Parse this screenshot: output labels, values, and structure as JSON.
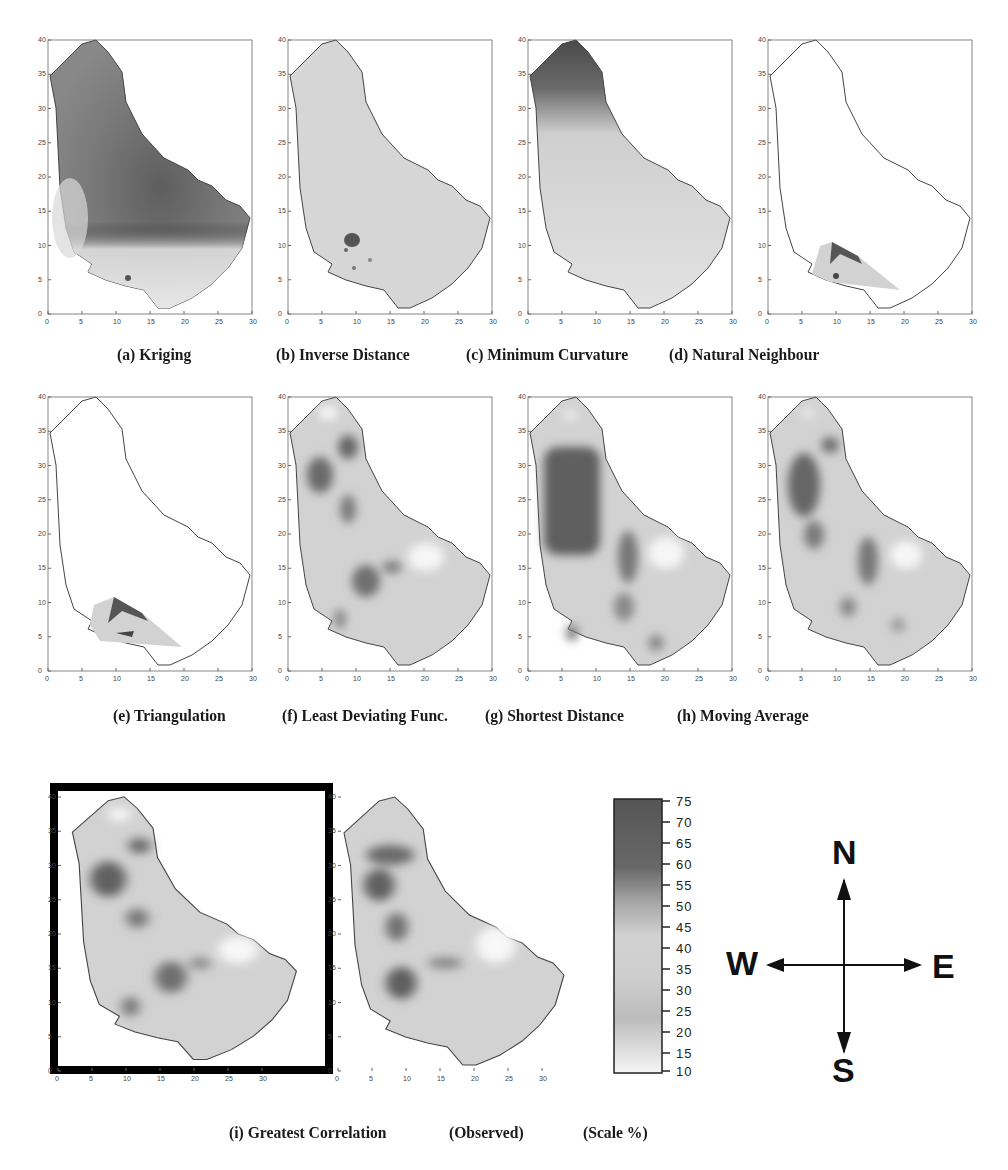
{
  "figure": {
    "row1_captions": [
      "(a) Kriging",
      "(b) Inverse Distance",
      "(c) Minimum Curvature",
      "(d) Natural Neighbour"
    ],
    "row2_captions": [
      "(e) Triangulation",
      "(f) Least Deviating Func.",
      "(g) Shortest Distance",
      "(h) Moving Average"
    ],
    "row3_captions": [
      "(i) Greatest Correlation",
      "(Observed)",
      "(Scale %)"
    ],
    "highlighted_panel": "(i) Greatest Correlation"
  },
  "axes": {
    "x_ticks": [
      "0",
      "5",
      "10",
      "15",
      "20",
      "25",
      "30"
    ],
    "y_ticks": [
      "0",
      "5",
      "10",
      "15",
      "20",
      "25",
      "30",
      "35",
      "40"
    ],
    "x_range": [
      0,
      30
    ],
    "y_range": [
      0,
      40
    ]
  },
  "panels": [
    {
      "id": "a",
      "method": "Kriging",
      "pattern": "dark central/north region, light south-west"
    },
    {
      "id": "b",
      "method": "Inverse Distance",
      "pattern": "uniform light with small dark spot near (9,11)"
    },
    {
      "id": "c",
      "method": "Minimum Curvature",
      "pattern": "dark north tip fading to light south"
    },
    {
      "id": "d",
      "method": "Natural Neighbour",
      "pattern": "only small south-west triangle filled"
    },
    {
      "id": "e",
      "method": "Triangulation",
      "pattern": "only small south-west triangle filled"
    },
    {
      "id": "f",
      "method": "Least Deviating Func.",
      "pattern": "dark patches west-central, light patch east"
    },
    {
      "id": "g",
      "method": "Shortest Distance",
      "pattern": "large dark block north-west, light patch east"
    },
    {
      "id": "h",
      "method": "Moving Average",
      "pattern": "dark patches north-west and central"
    },
    {
      "id": "i",
      "method": "Greatest Correlation",
      "pattern": "dark patches north-west and central, highlighted"
    },
    {
      "id": "obs",
      "method": "Observed",
      "pattern": "dark patches north-west and central-south"
    }
  ],
  "scale": {
    "title": "(Scale %)",
    "labels": [
      "75",
      "70",
      "65",
      "60",
      "55",
      "50",
      "45",
      "40",
      "35",
      "30",
      "25",
      "20",
      "15",
      "10"
    ],
    "min": 10,
    "max": 75,
    "colors": {
      "high": "#5a5a5a",
      "mid": "#bdbdbd",
      "low": "#f4f4f4"
    }
  },
  "compass": {
    "north": "N",
    "south": "S",
    "east": "E",
    "west": "W"
  }
}
